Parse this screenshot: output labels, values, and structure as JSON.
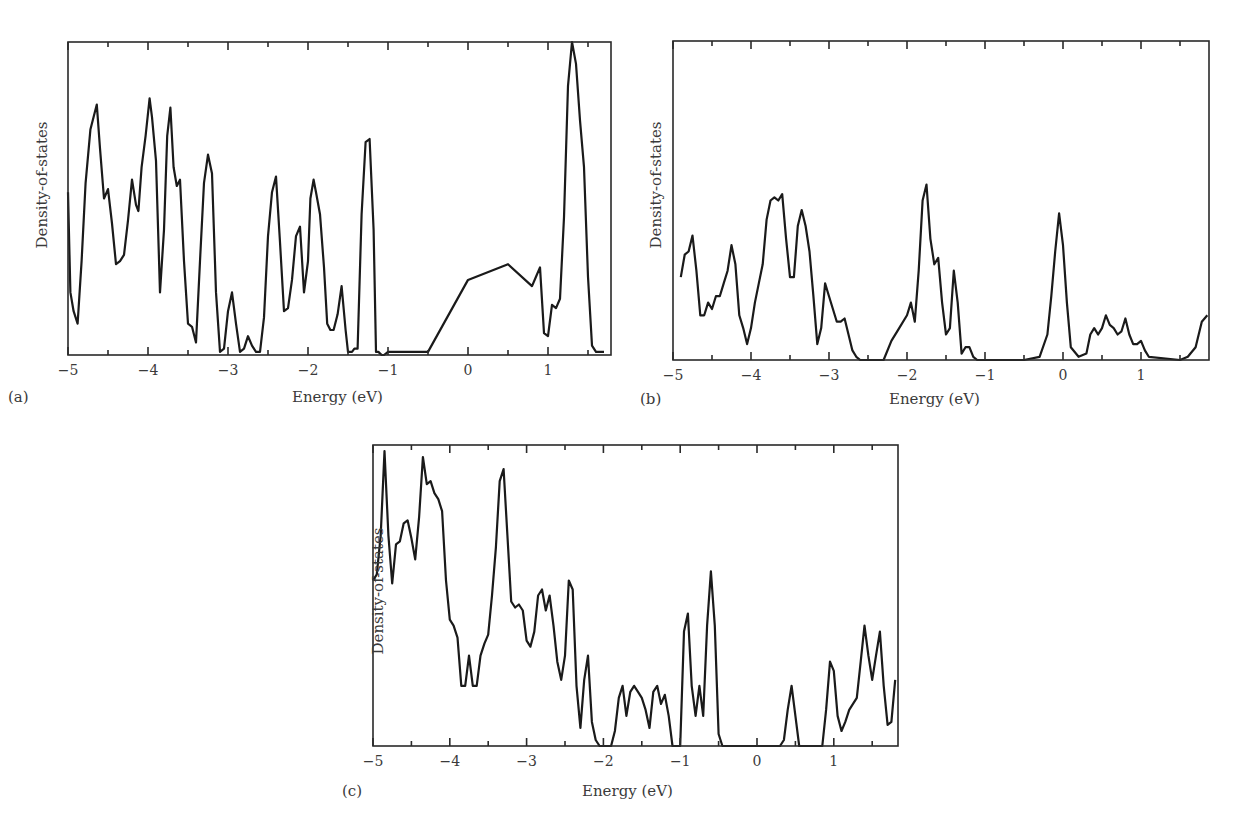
{
  "figure": {
    "panels": [
      {
        "id": "a",
        "label": "(a)",
        "xlabel": "Energy (eV)",
        "ylabel": "Density-of-states"
      },
      {
        "id": "b",
        "label": "(b)",
        "xlabel": "Energy (eV)",
        "ylabel": "Density-of-states"
      },
      {
        "id": "c",
        "label": "(c)",
        "xlabel": "Energy (eV)",
        "ylabel": "Density-of-states"
      }
    ],
    "xticks": [
      "−5",
      "−4",
      "−3",
      "−2",
      "−1",
      "0",
      "1"
    ]
  },
  "chart_data": [
    {
      "type": "line",
      "panel": "(a)",
      "title": "",
      "xlabel": "Energy (eV)",
      "ylabel": "Density-of-states",
      "xlim": [
        -5,
        1.8
      ],
      "ylim": [
        0,
        100
      ],
      "y_units": "arbitrary (0-100 = frame height)",
      "xticks": [
        -5,
        -4,
        -3,
        -2,
        -1,
        0,
        1
      ],
      "grid": false,
      "legend": "none",
      "series": [
        {
          "name": "DOS",
          "x": [
            -5.0,
            -4.97,
            -4.93,
            -4.88,
            -4.83,
            -4.78,
            -4.72,
            -4.68,
            -4.64,
            -4.6,
            -4.55,
            -4.5,
            -4.45,
            -4.4,
            -4.35,
            -4.3,
            -4.25,
            -4.2,
            -4.15,
            -4.12,
            -4.08,
            -4.03,
            -3.98,
            -3.95,
            -3.9,
            -3.85,
            -3.8,
            -3.76,
            -3.72,
            -3.68,
            -3.64,
            -3.6,
            -3.55,
            -3.5,
            -3.45,
            -3.4,
            -3.35,
            -3.3,
            -3.25,
            -3.2,
            -3.15,
            -3.1,
            -3.05,
            -3.0,
            -2.95,
            -2.9,
            -2.85,
            -2.8,
            -2.75,
            -2.7,
            -2.65,
            -2.6,
            -2.55,
            -2.5,
            -2.45,
            -2.4,
            -2.35,
            -2.3,
            -2.25,
            -2.2,
            -2.15,
            -2.1,
            -2.05,
            -2.0,
            -1.97,
            -1.93,
            -1.9,
            -1.85,
            -1.8,
            -1.76,
            -1.72,
            -1.68,
            -1.63,
            -1.58,
            -1.53,
            -1.5,
            -1.45,
            -1.42,
            -1.38,
            -1.33,
            -1.28,
            -1.23,
            -1.18,
            -1.15,
            -1.12,
            -1.08,
            -1.05,
            -1.0,
            -0.5,
            0.0,
            0.5,
            0.8,
            0.85,
            0.9,
            0.95,
            1.0,
            1.05,
            1.1,
            1.15,
            1.2,
            1.25,
            1.3,
            1.35,
            1.4,
            1.45,
            1.5,
            1.55,
            1.6,
            1.65,
            1.7,
            1.73,
            1.76,
            1.8
          ],
          "y": [
            52,
            20,
            14,
            10,
            30,
            55,
            72,
            76,
            80,
            66,
            50,
            53,
            42,
            29,
            30,
            32,
            43,
            56,
            48,
            46,
            60,
            70,
            82,
            76,
            62,
            20,
            40,
            70,
            79,
            60,
            54,
            56,
            30,
            10,
            9,
            4,
            30,
            55,
            64,
            58,
            20,
            1,
            2,
            14,
            20,
            10,
            1,
            2,
            6,
            3,
            1,
            1,
            12,
            38,
            52,
            57,
            36,
            14,
            15,
            24,
            38,
            41,
            20,
            30,
            50,
            56,
            52,
            45,
            28,
            10,
            8,
            8,
            13,
            22,
            8,
            1,
            1,
            2,
            2,
            45,
            68,
            69,
            40,
            1,
            1,
            0,
            0,
            1,
            1,
            24,
            29,
            22,
            25,
            28,
            7,
            6,
            16,
            15,
            18,
            44,
            86,
            100,
            93,
            75,
            60,
            25,
            3,
            1,
            1,
            1
          ]
        }
      ],
      "notes": "Filled sliver near -1.1 eV"
    },
    {
      "type": "line",
      "panel": "(b)",
      "title": "",
      "xlabel": "Energy (eV)",
      "ylabel": "Density-of-states",
      "xlim": [
        -5,
        1.85
      ],
      "ylim": [
        0,
        100
      ],
      "y_units": "arbitrary (0-100 = frame height)",
      "xticks": [
        -5,
        -4,
        -3,
        -2,
        -1,
        0,
        1
      ],
      "grid": false,
      "legend": "none",
      "series": [
        {
          "name": "DOS",
          "x": [
            -4.9,
            -4.85,
            -4.8,
            -4.75,
            -4.7,
            -4.65,
            -4.6,
            -4.55,
            -4.5,
            -4.45,
            -4.4,
            -4.35,
            -4.3,
            -4.25,
            -4.2,
            -4.15,
            -4.1,
            -4.05,
            -4.0,
            -3.95,
            -3.9,
            -3.85,
            -3.8,
            -3.75,
            -3.7,
            -3.65,
            -3.6,
            -3.55,
            -3.5,
            -3.45,
            -3.4,
            -3.35,
            -3.3,
            -3.25,
            -3.2,
            -3.15,
            -3.1,
            -3.05,
            -3.0,
            -2.95,
            -2.9,
            -2.85,
            -2.8,
            -2.75,
            -2.7,
            -2.65,
            -2.6,
            -2.5,
            -2.4,
            -2.3,
            -2.2,
            -2.1,
            -2.0,
            -1.95,
            -1.9,
            -1.85,
            -1.8,
            -1.75,
            -1.7,
            -1.65,
            -1.6,
            -1.55,
            -1.5,
            -1.45,
            -1.4,
            -1.35,
            -1.3,
            -1.25,
            -1.2,
            -1.15,
            -1.1,
            -1.05,
            -1.0,
            -0.5,
            -0.3,
            -0.2,
            -0.15,
            -0.1,
            -0.05,
            0.0,
            0.05,
            0.1,
            0.2,
            0.3,
            0.35,
            0.4,
            0.45,
            0.5,
            0.55,
            0.6,
            0.65,
            0.7,
            0.75,
            0.8,
            0.85,
            0.9,
            0.95,
            1.0,
            1.05,
            1.1,
            1.5,
            1.6,
            1.7,
            1.78,
            1.85
          ],
          "y": [
            26,
            33,
            34,
            39,
            28,
            14,
            14,
            18,
            16,
            20,
            20,
            24,
            28,
            36,
            30,
            14,
            10,
            5,
            10,
            18,
            24,
            30,
            44,
            50,
            51,
            50,
            52,
            38,
            26,
            26,
            42,
            47,
            42,
            34,
            20,
            5,
            10,
            24,
            20,
            16,
            12,
            12,
            13,
            8,
            3,
            1,
            0,
            0,
            0,
            0,
            6,
            10,
            14,
            18,
            12,
            28,
            50,
            55,
            38,
            30,
            32,
            18,
            8,
            10,
            28,
            18,
            2,
            4,
            4,
            1,
            0,
            0,
            0,
            0,
            1,
            8,
            20,
            34,
            46,
            36,
            18,
            4,
            1,
            2,
            8,
            10,
            8,
            10,
            14,
            11,
            10,
            8,
            9,
            13,
            8,
            5,
            5,
            6,
            3,
            1,
            0,
            1,
            4,
            12,
            14
          ]
        }
      ]
    },
    {
      "type": "line",
      "panel": "(c)",
      "title": "",
      "xlabel": "Energy (eV)",
      "ylabel": "Density-of-states",
      "xlim": [
        -5,
        1.8
      ],
      "ylim": [
        0,
        100
      ],
      "y_units": "arbitrary (0-100 = frame height)",
      "xticks": [
        -5,
        -4,
        -3,
        -2,
        -1,
        0,
        1
      ],
      "grid": false,
      "legend": "none",
      "series": [
        {
          "name": "DOS",
          "x": [
            -5.0,
            -4.95,
            -4.9,
            -4.85,
            -4.8,
            -4.75,
            -4.7,
            -4.65,
            -4.6,
            -4.55,
            -4.5,
            -4.45,
            -4.4,
            -4.35,
            -4.3,
            -4.25,
            -4.2,
            -4.15,
            -4.1,
            -4.05,
            -4.0,
            -3.95,
            -3.9,
            -3.85,
            -3.8,
            -3.75,
            -3.7,
            -3.65,
            -3.6,
            -3.55,
            -3.5,
            -3.45,
            -3.4,
            -3.35,
            -3.3,
            -3.25,
            -3.2,
            -3.15,
            -3.1,
            -3.05,
            -3.0,
            -2.95,
            -2.9,
            -2.85,
            -2.8,
            -2.75,
            -2.7,
            -2.65,
            -2.6,
            -2.55,
            -2.5,
            -2.45,
            -2.4,
            -2.35,
            -2.3,
            -2.25,
            -2.2,
            -2.15,
            -2.1,
            -2.05,
            -2.0,
            -1.9,
            -1.85,
            -1.8,
            -1.75,
            -1.7,
            -1.65,
            -1.6,
            -1.55,
            -1.5,
            -1.45,
            -1.4,
            -1.35,
            -1.3,
            -1.25,
            -1.2,
            -1.15,
            -1.1,
            -1.05,
            -1.0,
            -0.95,
            -0.9,
            -0.85,
            -0.8,
            -0.75,
            -0.7,
            -0.65,
            -0.6,
            -0.55,
            -0.5,
            -0.45,
            -0.4,
            -0.35,
            0.3,
            0.35,
            0.4,
            0.45,
            0.5,
            0.55,
            0.6,
            0.8,
            0.85,
            0.9,
            0.95,
            1.0,
            1.05,
            1.1,
            1.15,
            1.2,
            1.25,
            1.3,
            1.35,
            1.4,
            1.45,
            1.5,
            1.55,
            1.6,
            1.65,
            1.7,
            1.75,
            1.8
          ],
          "y": [
            55,
            57,
            70,
            98,
            70,
            54,
            67,
            68,
            74,
            75,
            69,
            62,
            76,
            96,
            87,
            88,
            84,
            82,
            78,
            55,
            42,
            40,
            36,
            20,
            20,
            30,
            20,
            20,
            30,
            34,
            37,
            50,
            66,
            88,
            92,
            70,
            48,
            46,
            47,
            45,
            35,
            33,
            38,
            50,
            52,
            45,
            50,
            40,
            28,
            22,
            30,
            55,
            52,
            20,
            6,
            22,
            30,
            8,
            2,
            0,
            0,
            0,
            5,
            16,
            20,
            10,
            18,
            20,
            18,
            16,
            12,
            6,
            18,
            20,
            14,
            17,
            10,
            0,
            0,
            0,
            38,
            44,
            20,
            10,
            20,
            10,
            40,
            58,
            40,
            4,
            0,
            0,
            0,
            0,
            2,
            12,
            20,
            10,
            0,
            0,
            0,
            0,
            12,
            28,
            25,
            10,
            5,
            8,
            12,
            14,
            16,
            28,
            40,
            30,
            22,
            30,
            38,
            20,
            7,
            8,
            22,
            28,
            8
          ]
        }
      ]
    }
  ]
}
